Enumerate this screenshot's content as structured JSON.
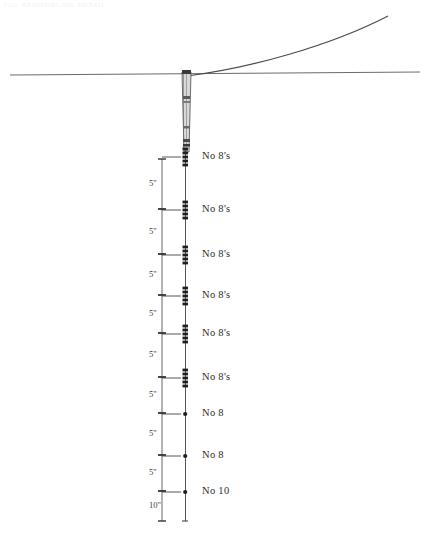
{
  "sheet": {
    "faint_header": "FIG.  REINFORCING DETAIL",
    "background": "#ffffff",
    "ink": "#2a2a2a"
  },
  "diagram": {
    "ground_line": {
      "name": "ground-line",
      "y": 74,
      "x_start": 10,
      "x_end": 420
    },
    "curved_line": {
      "name": "load-curve",
      "from_x": 186,
      "from_y": 76,
      "to_x": 390,
      "to_y": 16
    },
    "shaft": {
      "name": "pile-shaft",
      "x": 183,
      "top_y": 72,
      "bottom_y": 160,
      "width": 9
    },
    "cage_line": {
      "name": "reinforcement-cage-line",
      "x": 185,
      "top_y": 150,
      "bottom_y": 521
    }
  },
  "bars": [
    {
      "label": "No 8's",
      "y": 157,
      "marker": "dash-cluster"
    },
    {
      "label": "No 8's",
      "y": 210,
      "marker": "dash-cluster"
    },
    {
      "label": "No 8's",
      "y": 255,
      "marker": "dash-cluster"
    },
    {
      "label": "No 8's",
      "y": 296,
      "marker": "dash-cluster"
    },
    {
      "label": "No 8's",
      "y": 334,
      "marker": "dash-cluster"
    },
    {
      "label": "No 8's",
      "y": 378,
      "marker": "dash-cluster"
    },
    {
      "label": "No 8",
      "y": 414,
      "marker": "dot"
    },
    {
      "label": "No 8",
      "y": 456,
      "marker": "dot"
    },
    {
      "label": "No 10",
      "y": 492,
      "marker": "dot"
    }
  ],
  "dimensions": [
    {
      "value": "5\"",
      "from_y": 159,
      "to_y": 209
    },
    {
      "value": "5\"",
      "from_y": 209,
      "to_y": 254
    },
    {
      "value": "5\"",
      "from_y": 254,
      "to_y": 295
    },
    {
      "value": "5\"",
      "from_y": 295,
      "to_y": 333
    },
    {
      "value": "5\"",
      "from_y": 333,
      "to_y": 377
    },
    {
      "value": "5\"",
      "from_y": 377,
      "to_y": 413
    },
    {
      "value": "5\"",
      "from_y": 413,
      "to_y": 455
    },
    {
      "value": "5\"",
      "from_y": 455,
      "to_y": 491
    },
    {
      "value": "10\"",
      "from_y": 491,
      "to_y": 521
    }
  ],
  "geometry": {
    "dim_line_x": 162,
    "cage_x": 185,
    "label_x": 202,
    "leader_end_x": 181
  }
}
